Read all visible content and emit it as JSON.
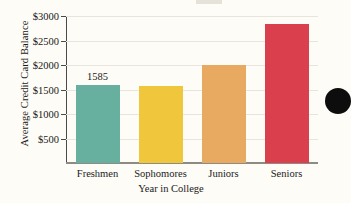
{
  "chart_data": {
    "type": "bar",
    "title": "",
    "xlabel": "Year in College",
    "ylabel": "Average Credit Card Balance",
    "categories": [
      "Freshmen",
      "Sophomores",
      "Juniors",
      "Seniors"
    ],
    "values": [
      1585,
      1575,
      2000,
      2840
    ],
    "value_labels": [
      "1585",
      "",
      "",
      ""
    ],
    "ylim": [
      0,
      3000
    ],
    "yticks": [
      500,
      1000,
      1500,
      2000,
      2500,
      3000
    ],
    "ytick_labels": [
      "$500",
      "$1000",
      "$1500",
      "$2000",
      "$2500",
      "$3000"
    ],
    "grid": true,
    "legend": false,
    "bar_colors": [
      "#67af9f",
      "#f0c53a",
      "#e8a košt"
    ]
  },
  "colors": {
    "freshmen": "#67af9f",
    "sophomores": "#f0c63c",
    "juniors": "#e8a960",
    "seniors": "#d93f4c",
    "background": "#fdfcf6",
    "axis": "#4a4a4a",
    "grid": "#e8e6dc",
    "text": "#1a1a1a"
  },
  "artifacts": {
    "page_dot": "black-circle-artifact"
  }
}
